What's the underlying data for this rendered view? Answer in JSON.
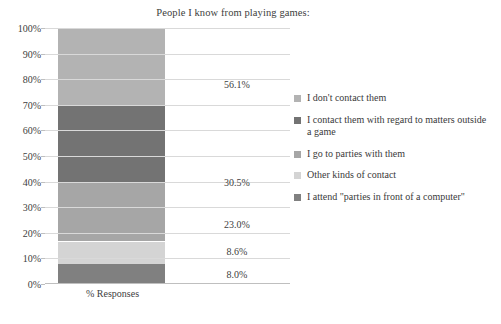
{
  "chart_data": {
    "type": "bar",
    "subtype": "stacked-bar-100",
    "title": "People I know from playing games:",
    "xlabel": "",
    "ylabel": "",
    "categories": [
      "% Responses"
    ],
    "ylim": [
      0,
      100
    ],
    "ytick_labels": [
      "0%",
      "10%",
      "20%",
      "30%",
      "40%",
      "50%",
      "60%",
      "70%",
      "80%",
      "90%",
      "100%"
    ],
    "ytick_values": [
      0,
      10,
      20,
      30,
      40,
      50,
      60,
      70,
      80,
      90,
      100
    ],
    "grid": true,
    "legend_position": "right",
    "stack_order": "bottom-to-top",
    "series": [
      {
        "name": "I attend \"parties in front of a computer\"",
        "value": 8.0,
        "label": "8.0%",
        "color": "#808080",
        "stack_start": 0.0,
        "stack_end": 8.0
      },
      {
        "name": "Other kinds of contact",
        "value": 8.6,
        "label": "8.6%",
        "color": "#d4d4d4",
        "stack_start": 8.0,
        "stack_end": 16.6
      },
      {
        "name": "I go to parties with them",
        "value": 23.0,
        "label": "23.0%",
        "color": "#a6a6a6",
        "stack_start": 16.6,
        "stack_end": 39.6
      },
      {
        "name": "I contact them with regard to matters outside a game",
        "value": 30.5,
        "label": "30.5%",
        "color": "#737373",
        "stack_start": 39.6,
        "stack_end": 70.1
      },
      {
        "name": "I don't contact them",
        "value": 56.1,
        "label": "56.1%",
        "color": "#b3b3b3",
        "stack_start": 70.1,
        "stack_end": 126.2
      }
    ],
    "legend_entries": [
      {
        "label": "I don't contact them",
        "color": "#b3b3b3"
      },
      {
        "label": "I contact them with regard to matters outside a game",
        "color": "#737373"
      },
      {
        "label": "I go to parties with them",
        "color": "#a6a6a6"
      },
      {
        "label": "Other kinds of contact",
        "color": "#d4d4d4"
      },
      {
        "label": "I attend \"parties in front of a computer\"",
        "color": "#808080"
      }
    ],
    "data_labels": [
      {
        "text": "56.1%",
        "at_percent": 78.0
      },
      {
        "text": "30.5%",
        "at_percent": 40.0
      },
      {
        "text": "23.0%",
        "at_percent": 23.5
      },
      {
        "text": "8.6%",
        "at_percent": 13.0
      },
      {
        "text": "8.0%",
        "at_percent": 4.0
      }
    ]
  },
  "colors": {
    "gridline": "#d9d9d9",
    "axis": "#bfbfbf",
    "text": "#404040",
    "background": "#ffffff"
  }
}
